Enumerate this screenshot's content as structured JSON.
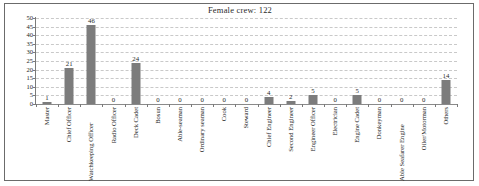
{
  "chart_data": {
    "type": "bar",
    "title": "Female crew: 122",
    "xlabel": "",
    "ylabel": "",
    "ylim": [
      0,
      50
    ],
    "yticks": [
      0,
      5,
      10,
      15,
      20,
      25,
      30,
      35,
      40,
      45,
      50
    ],
    "grid": true,
    "legend": "none",
    "bar_color": "#7c7c7c",
    "categories": [
      "Master",
      "Chief Officer",
      "Watchkeeping Officer",
      "Radio Officer",
      "Deck Cadet",
      "Bosun",
      "Able-seaman",
      "Ordinary seaman",
      "Cook",
      "Steward",
      "Chief Engineer",
      "Second Engineer",
      "Engineer Officer",
      "Electrician",
      "Engine Cadet",
      "Donkeyman",
      "Able Seafarer Engine",
      "Oiler/Motorman",
      "Others"
    ],
    "values": [
      1,
      21,
      46,
      0,
      24,
      0,
      0,
      0,
      0,
      0,
      4,
      2,
      5,
      0,
      5,
      0,
      0,
      0,
      14
    ],
    "data_labels": [
      "1",
      "21",
      "46",
      "0",
      "24",
      "0",
      "0",
      "0",
      "0",
      "0",
      "4",
      "2",
      "5",
      "0",
      "5",
      "0",
      "0",
      "0",
      "14"
    ]
  }
}
